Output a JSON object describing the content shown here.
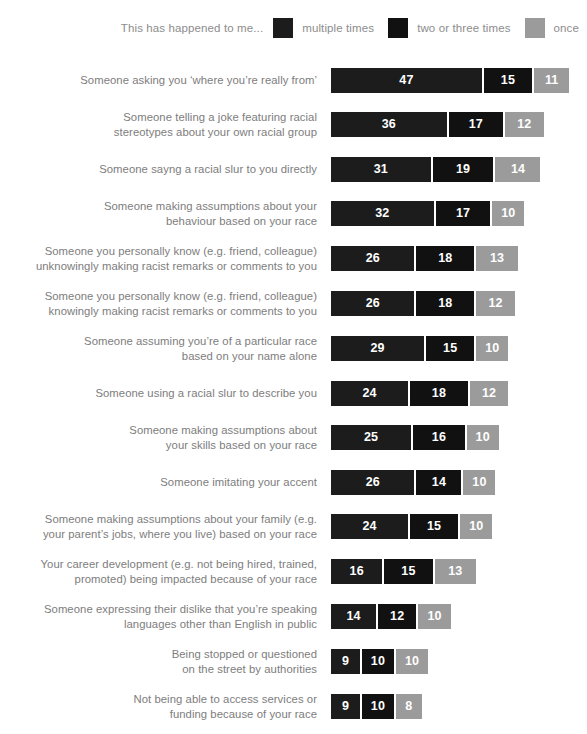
{
  "legend": {
    "intro": "This has happened to me...",
    "items": [
      {
        "label": "multiple times",
        "color": "#1c1c1c"
      },
      {
        "label": "two or three times",
        "color": "#111111"
      },
      {
        "label": "once",
        "color": "#9b9b9b"
      }
    ]
  },
  "chart_data": {
    "type": "bar",
    "orientation": "horizontal",
    "stacked": true,
    "title": "",
    "subtitle": "",
    "xlabel": "",
    "ylabel": "",
    "grid": false,
    "legend_position": "top-right",
    "value_unit": "percent",
    "px_per_unit": 3.21,
    "series": [
      {
        "name": "multiple times",
        "color": "#1c1c1c",
        "values": [
          47,
          36,
          31,
          32,
          26,
          26,
          29,
          24,
          25,
          26,
          24,
          16,
          14,
          9,
          9
        ]
      },
      {
        "name": "two or three times",
        "color": "#111111",
        "values": [
          15,
          17,
          19,
          17,
          18,
          18,
          15,
          18,
          16,
          14,
          15,
          15,
          12,
          10,
          10
        ]
      },
      {
        "name": "once",
        "color": "#9b9b9b",
        "values": [
          11,
          12,
          14,
          10,
          13,
          12,
          10,
          12,
          10,
          10,
          10,
          13,
          10,
          10,
          8
        ]
      }
    ],
    "categories": [
      "Someone asking you ‘where you’re really from’",
      "Someone telling a joke featuring racial stereotypes about your own racial group",
      "Someone sayng a racial slur to you directly",
      "Someone making assumptions about your behaviour based on your race",
      "Someone you personally know (e.g. friend, colleague) unknowingly making racist remarks or comments to you",
      "Someone you personally know (e.g. friend, colleague) knowingly making racist remarks or comments to you",
      "Someone assuming you’re of a particular race based on your name alone",
      "Someone using a racial slur to describe you",
      "Someone making assumptions about your skills based on your race",
      "Someone imitating your accent",
      "Someone making assumptions about your family (e.g. your parent’s jobs, where you live) based on your race",
      "Your career development (e.g. not being hired, trained, promoted) being impacted because of your race",
      "Someone expressing their dislike that you’re speaking languages other than English in public",
      "Being stopped or questioned on the street by authorities",
      "Not being able to access services or funding because of your race"
    ],
    "rows": [
      {
        "label_lines": [
          "Someone asking you ‘where you’re really from’"
        ],
        "values": [
          47,
          15,
          11
        ],
        "total": 73
      },
      {
        "label_lines": [
          "Someone telling a joke featuring racial",
          "stereotypes about your own racial group"
        ],
        "values": [
          36,
          17,
          12
        ],
        "total": 65
      },
      {
        "label_lines": [
          "Someone sayng a racial slur to you directly"
        ],
        "values": [
          31,
          19,
          14
        ],
        "total": 64
      },
      {
        "label_lines": [
          "Someone making assumptions about your",
          "behaviour based on your race"
        ],
        "values": [
          32,
          17,
          10
        ],
        "total": 59
      },
      {
        "label_lines": [
          "Someone you personally know (e.g. friend, colleague)",
          "unknowingly making racist remarks or comments to you"
        ],
        "values": [
          26,
          18,
          13
        ],
        "total": 57
      },
      {
        "label_lines": [
          "Someone you personally know (e.g. friend, colleague)",
          "knowingly making racist remarks or comments to you"
        ],
        "values": [
          26,
          18,
          12
        ],
        "total": 56
      },
      {
        "label_lines": [
          "Someone assuming you’re of a particular race",
          "based on your name alone"
        ],
        "values": [
          29,
          15,
          10
        ],
        "total": 54
      },
      {
        "label_lines": [
          "Someone using a racial slur to describe you"
        ],
        "values": [
          24,
          18,
          12
        ],
        "total": 54
      },
      {
        "label_lines": [
          "Someone making assumptions about",
          "your skills based on your race"
        ],
        "values": [
          25,
          16,
          10
        ],
        "total": 51
      },
      {
        "label_lines": [
          "Someone imitating your accent"
        ],
        "values": [
          26,
          14,
          10
        ],
        "total": 50
      },
      {
        "label_lines": [
          "Someone making assumptions about your family (e.g.",
          "your parent’s jobs, where you live) based on your race"
        ],
        "values": [
          24,
          15,
          10
        ],
        "total": 49
      },
      {
        "label_lines": [
          "Your career development (e.g. not being hired, trained,",
          "promoted) being impacted because of your race"
        ],
        "values": [
          16,
          15,
          13
        ],
        "total": 44
      },
      {
        "label_lines": [
          "Someone expressing their dislike that you’re speaking",
          "languages other than English in public"
        ],
        "values": [
          14,
          12,
          10
        ],
        "total": 36
      },
      {
        "label_lines": [
          "Being stopped or questioned",
          "on the street by authorities"
        ],
        "values": [
          9,
          10,
          10
        ],
        "total": 29
      },
      {
        "label_lines": [
          "Not being able to access services or",
          "funding because of your race"
        ],
        "values": [
          9,
          10,
          8
        ],
        "total": 27
      }
    ]
  }
}
